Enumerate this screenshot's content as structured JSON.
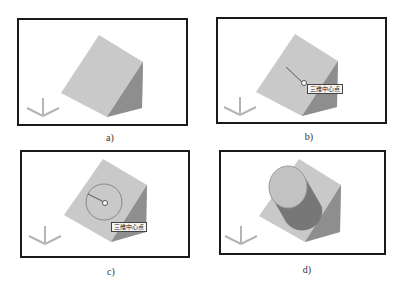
{
  "figures": [
    {
      "id": "a",
      "caption": "a)"
    },
    {
      "id": "b",
      "caption": "b)",
      "tooltip": "三维中心点"
    },
    {
      "id": "c",
      "caption": "c)",
      "tooltip": "三维中心点"
    },
    {
      "id": "d",
      "caption": "d)"
    }
  ],
  "colors": {
    "face_top": "#c9c9c9",
    "face_side": "#8e8e8e",
    "frame": "#1a1a1a",
    "ucs": "#b5b5b5"
  }
}
